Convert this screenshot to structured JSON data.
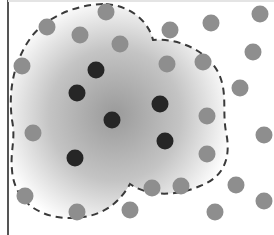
{
  "diagram": {
    "colors": {
      "background": "#ffffff",
      "frame": "#555555",
      "boundary": "#3a3a3a",
      "gradient_center": "#9a9a9a",
      "gradient_edge": "#ffffff",
      "core_point": "#262626",
      "border_point": "#8e8e8e"
    },
    "point_radius": 8.5,
    "core_points": [
      {
        "x": 96,
        "y": 70
      },
      {
        "x": 77,
        "y": 93
      },
      {
        "x": 112,
        "y": 120
      },
      {
        "x": 160,
        "y": 104
      },
      {
        "x": 165,
        "y": 141
      },
      {
        "x": 75,
        "y": 158
      }
    ],
    "other_points": [
      {
        "x": 106,
        "y": 12
      },
      {
        "x": 47,
        "y": 27
      },
      {
        "x": 80,
        "y": 35
      },
      {
        "x": 120,
        "y": 44
      },
      {
        "x": 170,
        "y": 30
      },
      {
        "x": 211,
        "y": 23
      },
      {
        "x": 260,
        "y": 14
      },
      {
        "x": 22,
        "y": 66
      },
      {
        "x": 167,
        "y": 64
      },
      {
        "x": 203,
        "y": 62
      },
      {
        "x": 253,
        "y": 52
      },
      {
        "x": 240,
        "y": 88
      },
      {
        "x": 207,
        "y": 116
      },
      {
        "x": 264,
        "y": 135
      },
      {
        "x": 33,
        "y": 133
      },
      {
        "x": 207,
        "y": 154
      },
      {
        "x": 25,
        "y": 196
      },
      {
        "x": 77,
        "y": 212
      },
      {
        "x": 130,
        "y": 210
      },
      {
        "x": 152,
        "y": 188
      },
      {
        "x": 181,
        "y": 186
      },
      {
        "x": 236,
        "y": 185
      },
      {
        "x": 215,
        "y": 212
      },
      {
        "x": 264,
        "y": 201
      }
    ],
    "boundary_path": "M 106 4 C 130 6, 148 20, 153 40 C 175 38, 205 48, 218 72 C 228 92, 222 110, 226 132 C 232 160, 222 178, 200 186 C 180 195, 150 198, 130 184 C 118 205, 100 218, 70 218 C 38 218, 14 200, 12 170 C 10 150, 16 140, 12 120 C 8 90, 14 60, 32 36 C 50 14, 80 4, 106 4 Z"
  }
}
